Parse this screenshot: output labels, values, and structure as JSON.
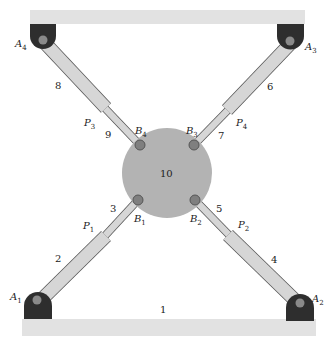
{
  "diagram": {
    "type": "parallel-mechanism-schematic",
    "colors": {
      "base_plate": "#e2e2e2",
      "anchor": "#2e2e2e",
      "joint": "#8a8a8a",
      "cylinder": "#d6d6d6",
      "cylinder_stroke": "#555555",
      "platform": "#b3b3b3"
    },
    "links": {
      "base_bottom": "1",
      "cyl_1": "2",
      "rod_1": "3",
      "cyl_2": "4",
      "rod_2": "5",
      "cyl_3": "6",
      "rod_3": "7",
      "cyl_4": "8",
      "rod_4": "9",
      "platform": "10"
    },
    "anchors": {
      "A1": {
        "base": "A",
        "sub": "1"
      },
      "A2": {
        "base": "A",
        "sub": "2"
      },
      "A3": {
        "base": "A",
        "sub": "3"
      },
      "A4": {
        "base": "A",
        "sub": "4"
      }
    },
    "joints": {
      "B1": {
        "base": "B",
        "sub": "1"
      },
      "B2": {
        "base": "B",
        "sub": "2"
      },
      "B3": {
        "base": "B",
        "sub": "3"
      },
      "B4": {
        "base": "B",
        "sub": "4"
      }
    },
    "prismatic": {
      "P1": {
        "base": "P",
        "sub": "1"
      },
      "P2": {
        "base": "P",
        "sub": "2"
      },
      "P3": {
        "base": "P",
        "sub": "3"
      },
      "P4": {
        "base": "P",
        "sub": "4"
      }
    }
  }
}
